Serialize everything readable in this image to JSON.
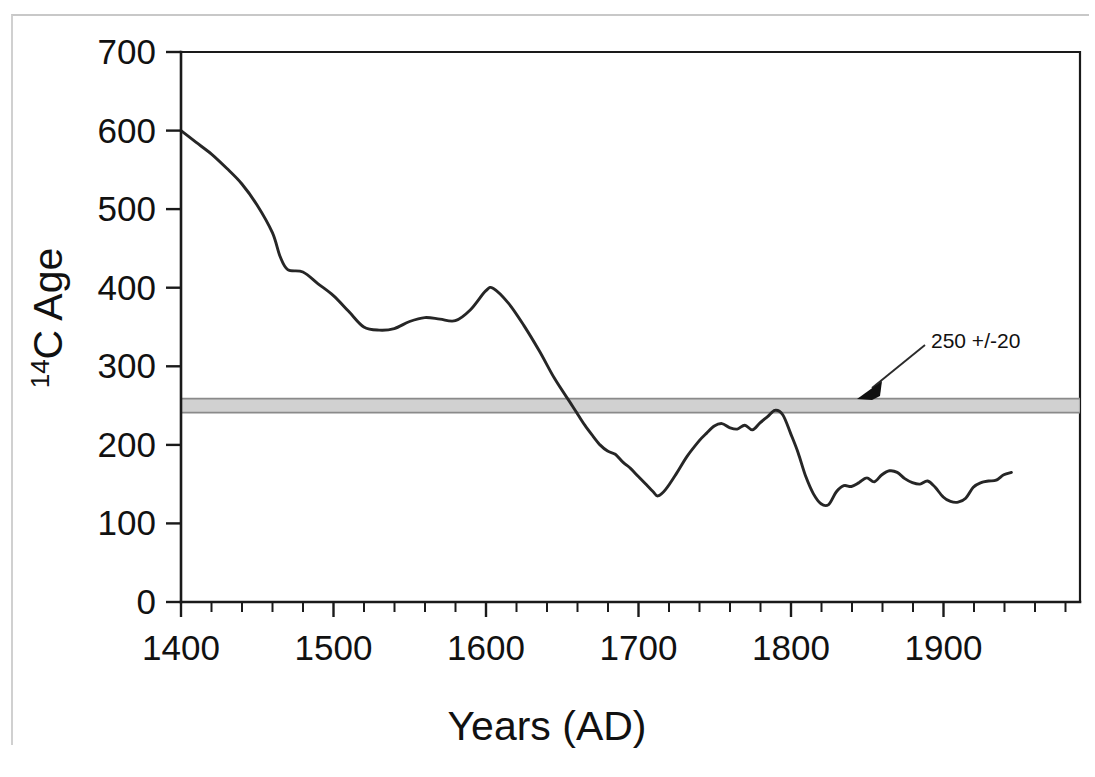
{
  "chart_data": {
    "type": "line",
    "title": "",
    "xlabel": "Years (AD)",
    "ylabel": "14C Age",
    "ylabel_superscript": "14",
    "ylabel_rest": "C Age",
    "xlim": [
      1400,
      1990
    ],
    "ylim": [
      0,
      700
    ],
    "x_ticks": [
      1400,
      1500,
      1600,
      1700,
      1800,
      1900
    ],
    "x_tick_labels": [
      "1400",
      "1500",
      "1600",
      "1700",
      "1800",
      "1900"
    ],
    "x_minor_step": 20,
    "y_ticks": [
      0,
      100,
      200,
      300,
      400,
      500,
      600,
      700
    ],
    "y_tick_labels": [
      "0",
      "100",
      "200",
      "300",
      "400",
      "500",
      "600",
      "700"
    ],
    "grid": false,
    "legend": null,
    "series": [
      {
        "name": "Atmospheric 14C calibration curve",
        "color": "#262626",
        "x": [
          1400,
          1410,
          1420,
          1430,
          1440,
          1450,
          1460,
          1465,
          1470,
          1480,
          1490,
          1500,
          1510,
          1520,
          1530,
          1540,
          1550,
          1560,
          1570,
          1580,
          1590,
          1600,
          1605,
          1615,
          1625,
          1635,
          1645,
          1655,
          1660,
          1665,
          1670,
          1675,
          1680,
          1685,
          1690,
          1695,
          1700,
          1705,
          1710,
          1713,
          1718,
          1725,
          1732,
          1740,
          1745,
          1750,
          1755,
          1760,
          1765,
          1770,
          1775,
          1780,
          1785,
          1790,
          1795,
          1800,
          1805,
          1810,
          1815,
          1820,
          1825,
          1830,
          1835,
          1840,
          1845,
          1850,
          1855,
          1860,
          1865,
          1870,
          1875,
          1880,
          1885,
          1890,
          1895,
          1900,
          1905,
          1910,
          1915,
          1920,
          1925,
          1930,
          1935,
          1940,
          1945
        ],
        "y": [
          600,
          585,
          570,
          552,
          532,
          505,
          470,
          440,
          423,
          420,
          405,
          390,
          370,
          350,
          346,
          348,
          357,
          362,
          360,
          358,
          372,
          396,
          399,
          380,
          352,
          320,
          285,
          255,
          240,
          225,
          212,
          200,
          192,
          188,
          178,
          170,
          160,
          150,
          140,
          135,
          143,
          163,
          185,
          205,
          215,
          224,
          227,
          222,
          220,
          225,
          219,
          228,
          236,
          244,
          238,
          215,
          190,
          160,
          138,
          125,
          124,
          140,
          148,
          147,
          152,
          158,
          153,
          162,
          167,
          165,
          157,
          152,
          150,
          154,
          146,
          134,
          128,
          127,
          132,
          146,
          152,
          154,
          155,
          162,
          165
        ]
      }
    ],
    "reference_band": {
      "label": "250 +/-20",
      "center": 250,
      "uncertainty": 20,
      "color": "#c9c9c9",
      "edge_color": "#8a8a8a"
    },
    "annotations": [
      {
        "text": "250 +/-20",
        "target_x": 1885,
        "target_y": 250,
        "text_x": 1950,
        "text_y": 330
      }
    ]
  },
  "figure": {
    "background": "#ffffff",
    "frame_color": "#1a1a1a",
    "outer_border_color": "#d0d0d0"
  }
}
